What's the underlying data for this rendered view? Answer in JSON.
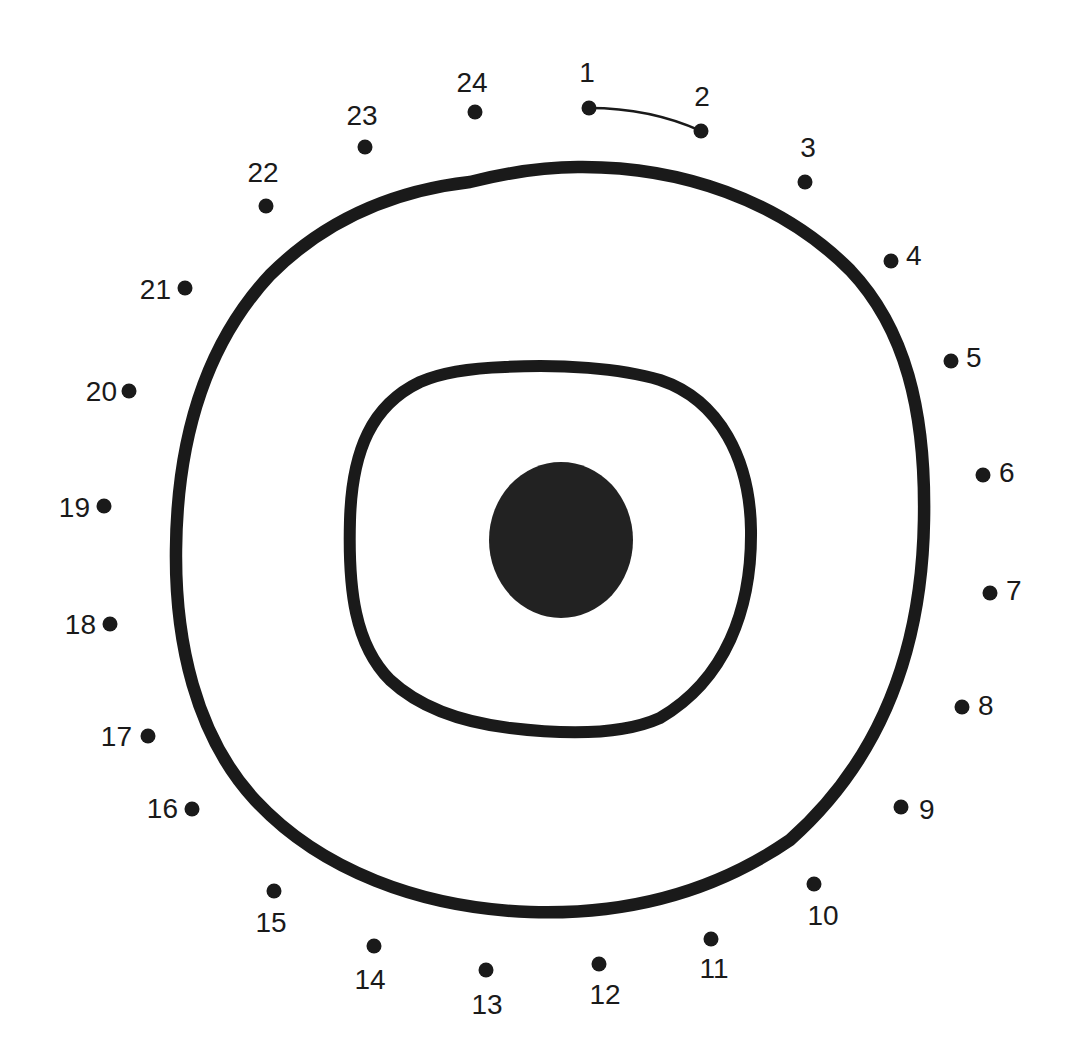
{
  "puzzle": {
    "type": "connect-the-dots",
    "ink_color": "#1a1a1a",
    "background": "#ffffff",
    "dots": [
      {
        "n": "1",
        "x": 589,
        "y": 108,
        "lx": 587,
        "ly": 82,
        "anchor": "middle"
      },
      {
        "n": "2",
        "x": 701,
        "y": 131,
        "lx": 702,
        "ly": 106,
        "anchor": "middle"
      },
      {
        "n": "3",
        "x": 805,
        "y": 182,
        "lx": 808,
        "ly": 157,
        "anchor": "middle"
      },
      {
        "n": "4",
        "x": 891,
        "y": 261,
        "lx": 906,
        "ly": 265,
        "anchor": "start"
      },
      {
        "n": "5",
        "x": 951,
        "y": 361,
        "lx": 966,
        "ly": 367,
        "anchor": "start"
      },
      {
        "n": "6",
        "x": 983,
        "y": 475,
        "lx": 999,
        "ly": 482,
        "anchor": "start"
      },
      {
        "n": "7",
        "x": 990,
        "y": 593,
        "lx": 1006,
        "ly": 600,
        "anchor": "start"
      },
      {
        "n": "8",
        "x": 962,
        "y": 707,
        "lx": 978,
        "ly": 715,
        "anchor": "start"
      },
      {
        "n": "9",
        "x": 901,
        "y": 807,
        "lx": 919,
        "ly": 819,
        "anchor": "start"
      },
      {
        "n": "10",
        "x": 814,
        "y": 884,
        "lx": 823,
        "ly": 925,
        "anchor": "middle"
      },
      {
        "n": "11",
        "x": 711,
        "y": 939,
        "lx": 714,
        "ly": 978,
        "anchor": "middle"
      },
      {
        "n": "12",
        "x": 599,
        "y": 964,
        "lx": 605,
        "ly": 1004,
        "anchor": "middle"
      },
      {
        "n": "13",
        "x": 486,
        "y": 970,
        "lx": 487,
        "ly": 1014,
        "anchor": "middle"
      },
      {
        "n": "14",
        "x": 374,
        "y": 946,
        "lx": 370,
        "ly": 989,
        "anchor": "middle"
      },
      {
        "n": "15",
        "x": 274,
        "y": 891,
        "lx": 271,
        "ly": 932,
        "anchor": "middle"
      },
      {
        "n": "16",
        "x": 192,
        "y": 809,
        "lx": 178,
        "ly": 818,
        "anchor": "end"
      },
      {
        "n": "17",
        "x": 148,
        "y": 736,
        "lx": 132,
        "ly": 746,
        "anchor": "end"
      },
      {
        "n": "18",
        "x": 110,
        "y": 624,
        "lx": 96,
        "ly": 634,
        "anchor": "end"
      },
      {
        "n": "19",
        "x": 104,
        "y": 506,
        "lx": 90,
        "ly": 517,
        "anchor": "end"
      },
      {
        "n": "20",
        "x": 129,
        "y": 391,
        "lx": 117,
        "ly": 401,
        "anchor": "end"
      },
      {
        "n": "21",
        "x": 185,
        "y": 288,
        "lx": 171,
        "ly": 299,
        "anchor": "end"
      },
      {
        "n": "22",
        "x": 266,
        "y": 206,
        "lx": 263,
        "ly": 182,
        "anchor": "middle"
      },
      {
        "n": "23",
        "x": 365,
        "y": 147,
        "lx": 362,
        "ly": 125,
        "anchor": "middle"
      },
      {
        "n": "24",
        "x": 475,
        "y": 112,
        "lx": 472,
        "ly": 92,
        "anchor": "middle"
      }
    ],
    "connected_segment": {
      "from": "1",
      "to": "2"
    },
    "shapes": {
      "outer_ring": "outer-ring",
      "inner_ring": "inner-ring",
      "center_blob": "pupil"
    }
  }
}
